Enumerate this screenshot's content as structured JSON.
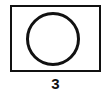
{
  "figure": {
    "shape": "circle-in-rectangle",
    "label": "3",
    "stroke_color": "#111111",
    "background_color": "#ffffff"
  }
}
